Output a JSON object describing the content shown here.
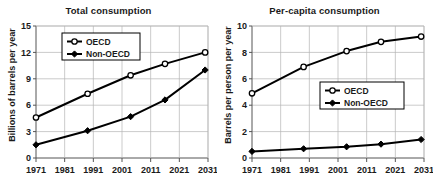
{
  "figure": {
    "background_color": "#ffffff",
    "line_color": "#000000",
    "grid_color": "#b5b5b5",
    "axis_color": "#555555"
  },
  "panels": [
    {
      "id": "total-consumption",
      "title": "Total consumption",
      "ylabel": "Billions of barrels per year",
      "xlabel": "",
      "ytick_labels": [
        "0",
        "3",
        "6",
        "9",
        "12",
        "15"
      ],
      "xtick_labels": [
        "1971",
        "1981",
        "1991",
        "2001",
        "2011",
        "2021",
        "2031"
      ],
      "legend": [
        {
          "label": "OECD",
          "marker": "open-circle"
        },
        {
          "label": "Non-OECD",
          "marker": "filled-diamond"
        }
      ]
    },
    {
      "id": "per-capita-consumption",
      "title": "Per-capita consumption",
      "ylabel": "Barrels per person per year",
      "xlabel": "",
      "ytick_labels": [
        "0",
        "2",
        "4",
        "6",
        "8",
        "10"
      ],
      "xtick_labels": [
        "1971",
        "1981",
        "1991",
        "2001",
        "2011",
        "2021",
        "2031"
      ],
      "legend": [
        {
          "label": "OECD",
          "marker": "open-circle"
        },
        {
          "label": "Non-OECD",
          "marker": "filled-diamond"
        }
      ]
    }
  ],
  "chart_data": [
    {
      "type": "line",
      "title": "Total consumption",
      "xlabel": "",
      "ylabel": "Billions of barrels per year",
      "xlim": [
        1971,
        2031
      ],
      "ylim": [
        0,
        15
      ],
      "yticks": [
        0,
        3,
        6,
        9,
        12,
        15
      ],
      "xticks": [
        1971,
        1981,
        1991,
        2001,
        2011,
        2021,
        2031
      ],
      "grid": true,
      "legend_position": "upper-left",
      "x": [
        1971,
        1989,
        2004,
        2016,
        2030
      ],
      "series": [
        {
          "name": "OECD",
          "marker": "open-circle",
          "values": [
            4.6,
            7.3,
            9.4,
            10.7,
            12.0
          ]
        },
        {
          "name": "Non-OECD",
          "marker": "filled-diamond",
          "values": [
            1.5,
            3.1,
            4.7,
            6.6,
            10.0
          ]
        }
      ]
    },
    {
      "type": "line",
      "title": "Per-capita consumption",
      "xlabel": "",
      "ylabel": "Barrels per person per year",
      "xlim": [
        1971,
        2031
      ],
      "ylim": [
        0,
        10
      ],
      "yticks": [
        0,
        2,
        4,
        6,
        8,
        10
      ],
      "xticks": [
        1971,
        1981,
        1991,
        2001,
        2011,
        2021,
        2031
      ],
      "grid": true,
      "legend_position": "middle-right",
      "x": [
        1971,
        1989,
        2004,
        2016,
        2030
      ],
      "series": [
        {
          "name": "OECD",
          "marker": "open-circle",
          "values": [
            4.9,
            6.9,
            8.1,
            8.8,
            9.2
          ]
        },
        {
          "name": "Non-OECD",
          "marker": "filled-diamond",
          "values": [
            0.5,
            0.7,
            0.85,
            1.05,
            1.4
          ]
        }
      ]
    }
  ]
}
